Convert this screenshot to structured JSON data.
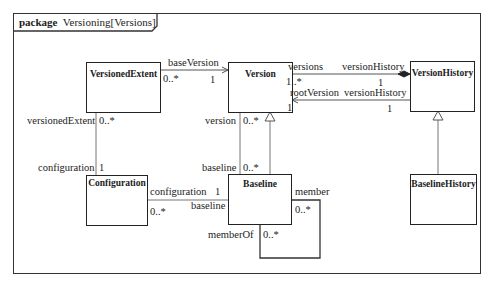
{
  "package": {
    "keyword": "package",
    "name": "Versioning[Versions]"
  },
  "classes": {
    "versioned_extent": "VersionedExtent",
    "version": "Version",
    "version_history": "VersionHistory",
    "configuration": "Configuration",
    "baseline": "Baseline",
    "baseline_history": "BaselineHistory"
  },
  "associations": {
    "base_version": {
      "role": "baseVersion",
      "source_mult": "0..*",
      "target_mult": "1"
    },
    "versions_history": {
      "role_version": "versions",
      "role_history": "versionHistory",
      "version_mult": "1..*",
      "history_mult": "1"
    },
    "root_version": {
      "role_version": "rootVersion",
      "role_history": "versionHistory",
      "version_mult": "1",
      "history_mult": "1"
    },
    "extent_configuration": {
      "role_extent": "versionedExtent",
      "extent_mult": "0..*",
      "role_config": "configuration",
      "config_mult": "1"
    },
    "version_baseline": {
      "role_version": "version",
      "version_mult": "0..*",
      "role_baseline": "baseline",
      "baseline_mult": "0..*"
    },
    "configuration_baseline": {
      "role_config": "configuration",
      "config_mult": "1",
      "role_baseline": "baseline",
      "baseline_mult": "0..*"
    },
    "baseline_member": {
      "role_member": "member",
      "member_mult": "0..*",
      "role_member_of": "memberOf",
      "member_of_mult": "0..*"
    }
  }
}
